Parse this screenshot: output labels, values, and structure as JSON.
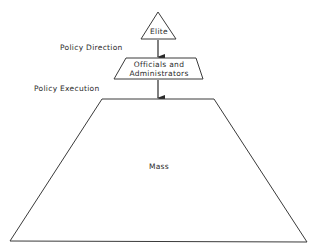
{
  "diagram": {
    "type": "hierarchy-pyramid",
    "levels": [
      {
        "id": "elite",
        "label": "Elite",
        "shape": "triangle"
      },
      {
        "id": "officials",
        "label_line1": "Officials and",
        "label_line2": "Administrators",
        "shape": "trapezoid"
      },
      {
        "id": "mass",
        "label": "Mass",
        "shape": "trapezoid"
      }
    ],
    "connectors": [
      {
        "from": "elite",
        "to": "officials",
        "label": "Policy Direction",
        "direction": "down"
      },
      {
        "from": "officials",
        "to": "mass",
        "label": "Policy Execution",
        "direction": "down"
      }
    ],
    "colors": {
      "stroke": "#3a3a3a",
      "text": "#2a2a2a",
      "background": "#ffffff"
    }
  }
}
